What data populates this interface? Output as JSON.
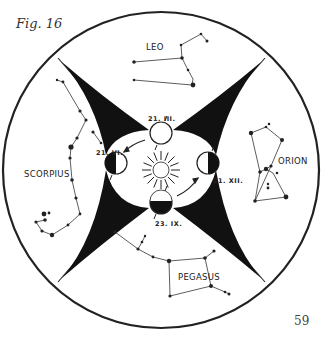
{
  "figure": {
    "label": "Fig. 16",
    "page_number": "59"
  },
  "constellations": {
    "top": "LEO",
    "left": "SCORPIUS",
    "right": "ORION",
    "bottom": "PEGASUS"
  },
  "earth_positions": {
    "top": "21. III.",
    "left": "21. VI.",
    "right": "21. XII.",
    "bottom": "23. IX."
  },
  "center": "sun-icon"
}
